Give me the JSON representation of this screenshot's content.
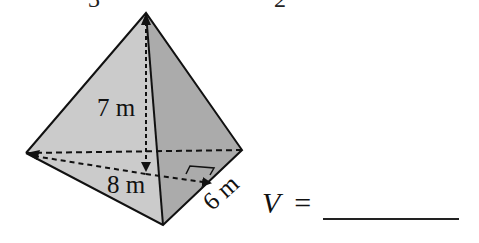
{
  "top_fragments": [
    "3",
    "2"
  ],
  "figure": {
    "shape": "triangular pyramid",
    "labels": {
      "height": "7 m",
      "base_side": "8 m",
      "base_height": "6 m"
    },
    "colors": {
      "left_face": "#c8c8c8",
      "right_face": "#a8a8a8",
      "stroke": "#111111"
    }
  },
  "answer": {
    "variable": "V",
    "equals": "=",
    "value": ""
  }
}
